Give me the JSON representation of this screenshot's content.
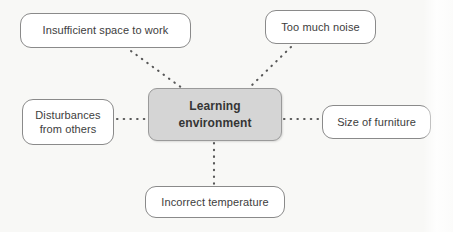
{
  "diagram": {
    "title": "Learning environment",
    "type": "mind-map",
    "background_color": "#f8f8f6",
    "center": {
      "id": "center",
      "label": "Learning\nenvironment",
      "fill_color": "#d5d5d5",
      "border_color": "#9a9a9a",
      "text_color": "#353535"
    },
    "branches": [
      {
        "id": "insufficient-space",
        "label": "Insufficient space to work",
        "position": "top-left",
        "fill_color": "#ffffff",
        "border_color": "#8a8a8a",
        "text_color": "#3d3d3d"
      },
      {
        "id": "too-much-noise",
        "label": "Too much noise",
        "position": "top-right",
        "fill_color": "#ffffff",
        "border_color": "#8a8a8a",
        "text_color": "#3d3d3d"
      },
      {
        "id": "disturbances",
        "label": "Disturbances\nfrom others",
        "position": "left",
        "fill_color": "#ffffff",
        "border_color": "#8a8a8a",
        "text_color": "#3d3d3d"
      },
      {
        "id": "size-of-furniture",
        "label": "Size of furniture",
        "position": "right",
        "fill_color": "#ffffff",
        "border_color": "#8a8a8a",
        "text_color": "#3d3d3d"
      },
      {
        "id": "incorrect-temperature",
        "label": "Incorrect temperature",
        "position": "bottom",
        "fill_color": "#ffffff",
        "border_color": "#8a8a8a",
        "text_color": "#3d3d3d"
      }
    ],
    "connectors": {
      "style": "dotted",
      "color": "#585858",
      "edges": [
        {
          "from": "insufficient-space",
          "to": "center"
        },
        {
          "from": "too-much-noise",
          "to": "center"
        },
        {
          "from": "disturbances",
          "to": "center"
        },
        {
          "from": "size-of-furniture",
          "to": "center"
        },
        {
          "from": "incorrect-temperature",
          "to": "center"
        }
      ]
    }
  }
}
